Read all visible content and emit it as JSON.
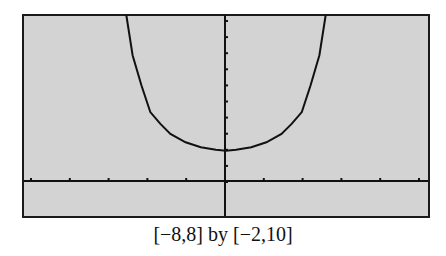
{
  "chart_data": {
    "type": "line",
    "title": "",
    "caption": "[−8,8] by [−2,10]",
    "xlabel": "",
    "ylabel": "",
    "xlim": [
      -8,
      8
    ],
    "ylim": [
      -2,
      10
    ],
    "grid": false,
    "legend": null,
    "series": [
      {
        "name": "curve",
        "description": "U-shaped symmetric curve with minimum about y=2 at x=0, exits top of window near x=−4 and x=4",
        "x": [
          -3.95,
          -3.7,
          -3.35,
          -3.0,
          -2.6,
          -2.2,
          -1.6,
          -1.0,
          -0.4,
          0,
          0.4,
          1.0,
          1.6,
          2.2,
          2.6,
          3.0,
          3.35,
          3.7,
          3.95
        ],
        "y": [
          10,
          7.6,
          5.8,
          4.2,
          3.5,
          2.9,
          2.4,
          2.1,
          1.95,
          1.9,
          1.95,
          2.1,
          2.4,
          2.9,
          3.5,
          4.2,
          5.8,
          7.6,
          10
        ]
      }
    ],
    "x_ticks_count": 11,
    "y_ticks_count": 11
  }
}
